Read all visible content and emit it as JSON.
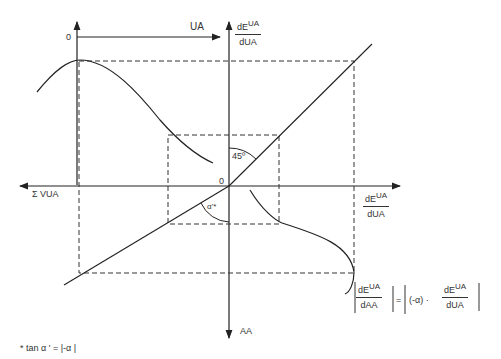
{
  "axes": {
    "top_origin": "0",
    "top_x_label": "UA",
    "center_origin": "0",
    "left_x_label": "Σ VUA",
    "bottom_y_label": "AA",
    "top_y_label": {
      "num": "dE",
      "num_sup": "UA",
      "den": "dUA"
    },
    "right_x_label": {
      "num": "dE",
      "num_sup": "UA",
      "den": "dUA"
    }
  },
  "angles": {
    "upper": "45º",
    "lower": "α'*"
  },
  "formula": {
    "lhs_num": "dE",
    "lhs_num_sup": "UA",
    "lhs_den": "dAA",
    "equals": "=",
    "rhs_factor": "(-α) ·",
    "rhs_num": "dE",
    "rhs_num_sup": "UA",
    "rhs_den": "dUA"
  },
  "footnote": "* tan  α ' =  |-α |"
}
